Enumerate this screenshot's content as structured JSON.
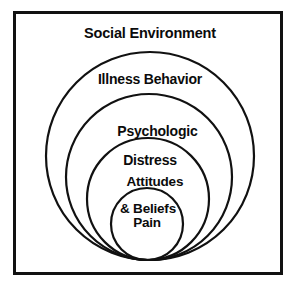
{
  "diagram": {
    "kind": "nested-concentric-circles",
    "title": "Social Environment",
    "background_color": "#ffffff",
    "stroke_color": "#111111",
    "text_color": "#0b0b0b",
    "frame": {
      "border_color": "#111111",
      "border_width_px": 3,
      "x": 13,
      "y": 11,
      "width": 264,
      "height": 258
    },
    "layers": [
      {
        "id": "social-environment",
        "label": "Social Environment",
        "label_line_1": "Social Environment",
        "label_line_2": "",
        "level": 1,
        "shape": "rectangle-region",
        "cx": 150,
        "cy": 33,
        "r": 0
      },
      {
        "id": "illness-behavior",
        "label": "Illness Behavior",
        "label_line_1": "Illness Behavior",
        "label_line_2": "",
        "level": 2,
        "shape": "circle",
        "cx": 150,
        "cy": 156,
        "r": 104
      },
      {
        "id": "psychologic-distress",
        "label": "Psychologic Distress",
        "label_line_1": "Psychologic",
        "label_line_2": "Distress",
        "level": 3,
        "shape": "circle",
        "cx": 149,
        "cy": 177,
        "r": 83
      },
      {
        "id": "attitudes-beliefs",
        "label": "Attitudes & Beliefs",
        "label_line_1": "Attitudes",
        "label_line_2": "& Beliefs",
        "level": 4,
        "shape": "circle",
        "cx": 148,
        "cy": 199,
        "r": 61
      },
      {
        "id": "pain",
        "label": "Pain",
        "label_line_1": "Pain",
        "label_line_2": "",
        "level": 5,
        "shape": "circle",
        "cx": 147,
        "cy": 224,
        "r": 36
      }
    ]
  }
}
